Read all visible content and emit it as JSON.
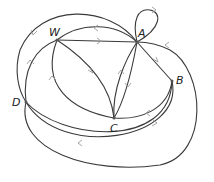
{
  "diagram": {
    "type": "directed-multigraph",
    "nodes": [
      {
        "id": "W",
        "label": "W"
      },
      {
        "id": "A",
        "label": "A"
      },
      {
        "id": "B",
        "label": "B"
      },
      {
        "id": "C",
        "label": "C"
      },
      {
        "id": "D",
        "label": "D"
      }
    ],
    "edges": [
      {
        "from": "A",
        "to": "A",
        "kind": "loop"
      },
      {
        "from": "W",
        "to": "A"
      },
      {
        "from": "A",
        "to": "W"
      },
      {
        "from": "D",
        "to": "A"
      },
      {
        "from": "D",
        "to": "W"
      },
      {
        "from": "W",
        "to": "C"
      },
      {
        "from": "C",
        "to": "W"
      },
      {
        "from": "A",
        "to": "C"
      },
      {
        "from": "C",
        "to": "A"
      },
      {
        "from": "A",
        "to": "B"
      },
      {
        "from": "B",
        "to": "C"
      },
      {
        "from": "D",
        "to": "B"
      },
      {
        "from": "B",
        "to": "D"
      },
      {
        "from": "D",
        "to": "A",
        "kind": "outer-right"
      }
    ]
  }
}
